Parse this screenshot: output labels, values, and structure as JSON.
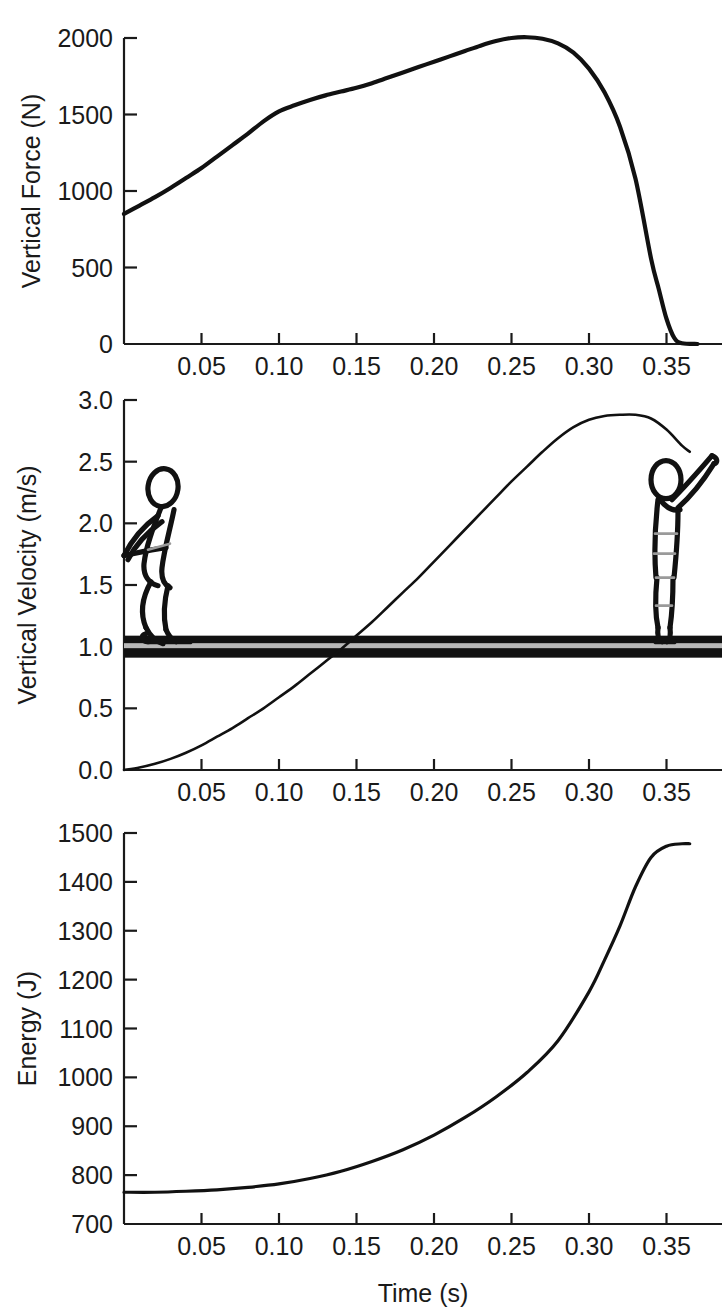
{
  "figure": {
    "title": "",
    "panel_count": 3,
    "xlabel": "Time (s)"
  },
  "panels": [
    {
      "id": "force",
      "ylabel": "Vertical Force (N)",
      "xlabel": "",
      "yticks": [
        "0",
        "500",
        "1000",
        "1500",
        "2000"
      ],
      "xticks": [
        "0.05",
        "0.10",
        "0.15",
        "0.20",
        "0.25",
        "0.30",
        "0.35"
      ]
    },
    {
      "id": "velocity",
      "ylabel": "Vertical Velocity (m/s)",
      "xlabel": "",
      "yticks": [
        "0.0",
        "0.5",
        "1.0",
        "1.5",
        "2.0",
        "2.5",
        "3.0"
      ],
      "xticks": [
        "0.05",
        "0.10",
        "0.15",
        "0.20",
        "0.25",
        "0.30",
        "0.35"
      ]
    },
    {
      "id": "energy",
      "ylabel": "Energy (J)",
      "xlabel": "Time (s)",
      "yticks": [
        "700",
        "800",
        "900",
        "1000",
        "1100",
        "1200",
        "1300",
        "1400",
        "1500"
      ],
      "xticks": [
        "0.05",
        "0.10",
        "0.15",
        "0.20",
        "0.25",
        "0.30",
        "0.35"
      ]
    }
  ],
  "annotations": {
    "ground_line_label": "ground-line",
    "left_figure_label": "crouched-jumper-figure",
    "right_figure_label": "extended-jumper-figure"
  },
  "colors": {
    "curve": "#111111",
    "axis": "#1a1a1a",
    "ground": "#111111",
    "ground_inner": "#b8b8b8",
    "background": "#ffffff"
  },
  "chart_data": [
    {
      "type": "line",
      "id": "vertical-force",
      "title": "",
      "xlabel": "",
      "ylabel": "Vertical Force (N)",
      "xlim": [
        0,
        0.375
      ],
      "ylim": [
        0,
        2150
      ],
      "grid": false,
      "legend": "none",
      "xticks": [
        0.05,
        0.1,
        0.15,
        0.2,
        0.25,
        0.3,
        0.35
      ],
      "yticks": [
        0,
        500,
        1000,
        1500,
        2000
      ],
      "x": [
        0.0,
        0.01,
        0.02,
        0.03,
        0.04,
        0.05,
        0.06,
        0.07,
        0.08,
        0.09,
        0.1,
        0.11,
        0.12,
        0.13,
        0.14,
        0.15,
        0.16,
        0.17,
        0.18,
        0.19,
        0.2,
        0.21,
        0.22,
        0.23,
        0.24,
        0.25,
        0.26,
        0.27,
        0.28,
        0.29,
        0.3,
        0.31,
        0.32,
        0.33,
        0.34,
        0.345,
        0.35,
        0.355,
        0.36,
        0.37
      ],
      "y": [
        850,
        905,
        960,
        1020,
        1085,
        1150,
        1225,
        1300,
        1375,
        1455,
        1520,
        1560,
        1595,
        1625,
        1650,
        1675,
        1705,
        1740,
        1775,
        1810,
        1845,
        1880,
        1915,
        1950,
        1980,
        2000,
        2005,
        1995,
        1965,
        1905,
        1800,
        1645,
        1420,
        1080,
        560,
        360,
        165,
        40,
        5,
        0
      ]
    },
    {
      "type": "line",
      "id": "vertical-velocity",
      "title": "",
      "xlabel": "",
      "ylabel": "Vertical Velocity (m/s)",
      "xlim": [
        0,
        0.375
      ],
      "ylim": [
        0,
        3.05
      ],
      "grid": false,
      "legend": "none",
      "xticks": [
        0.05,
        0.1,
        0.15,
        0.2,
        0.25,
        0.3,
        0.35
      ],
      "yticks": [
        0.0,
        0.5,
        1.0,
        1.5,
        2.0,
        2.5,
        3.0
      ],
      "ground_level": 1.0,
      "x": [
        0.0,
        0.01,
        0.02,
        0.03,
        0.04,
        0.05,
        0.06,
        0.07,
        0.08,
        0.09,
        0.1,
        0.11,
        0.12,
        0.13,
        0.14,
        0.15,
        0.16,
        0.17,
        0.18,
        0.19,
        0.2,
        0.21,
        0.22,
        0.23,
        0.24,
        0.25,
        0.26,
        0.27,
        0.28,
        0.29,
        0.3,
        0.31,
        0.32,
        0.33,
        0.34,
        0.35,
        0.36,
        0.365
      ],
      "y": [
        0.0,
        0.02,
        0.05,
        0.09,
        0.14,
        0.2,
        0.27,
        0.34,
        0.42,
        0.5,
        0.59,
        0.68,
        0.78,
        0.88,
        0.98,
        1.09,
        1.2,
        1.32,
        1.44,
        1.56,
        1.69,
        1.82,
        1.95,
        2.08,
        2.21,
        2.34,
        2.46,
        2.58,
        2.69,
        2.78,
        2.84,
        2.87,
        2.88,
        2.88,
        2.85,
        2.76,
        2.63,
        2.58
      ]
    },
    {
      "type": "line",
      "id": "energy",
      "title": "",
      "xlabel": "Time (s)",
      "ylabel": "Energy (J)",
      "xlim": [
        0,
        0.375
      ],
      "ylim": [
        700,
        1510
      ],
      "grid": false,
      "legend": "none",
      "xticks": [
        0.05,
        0.1,
        0.15,
        0.2,
        0.25,
        0.3,
        0.35
      ],
      "yticks": [
        700,
        800,
        900,
        1000,
        1100,
        1200,
        1300,
        1400,
        1500
      ],
      "x": [
        0.0,
        0.02,
        0.04,
        0.06,
        0.08,
        0.1,
        0.12,
        0.14,
        0.16,
        0.18,
        0.2,
        0.22,
        0.24,
        0.26,
        0.28,
        0.3,
        0.31,
        0.32,
        0.33,
        0.34,
        0.35,
        0.36,
        0.365
      ],
      "y": [
        765,
        765,
        767,
        770,
        775,
        782,
        793,
        808,
        828,
        852,
        882,
        918,
        960,
        1010,
        1075,
        1175,
        1240,
        1310,
        1390,
        1450,
        1473,
        1478,
        1478
      ]
    }
  ]
}
